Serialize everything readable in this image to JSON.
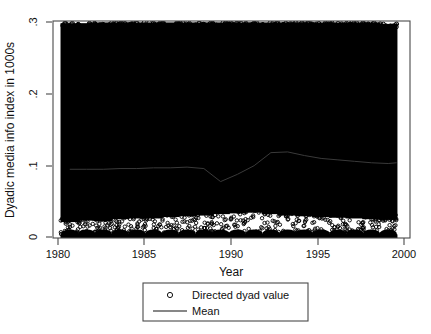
{
  "chart_data": {
    "type": "scatter",
    "title": "",
    "subtitle": "",
    "xlabel": "Year",
    "ylabel": "Dyadic media info index in 1000s",
    "xlim": [
      1979.0,
      2000.3
    ],
    "ylim": [
      0,
      0.3
    ],
    "xticks": [
      1980,
      1985,
      1990,
      1995,
      2000
    ],
    "xticklabels": [
      "1980",
      "1985",
      "1990",
      "1995",
      "2000"
    ],
    "yticks": [
      0,
      0.1,
      0.2,
      0.3
    ],
    "yticklabels": [
      "0",
      ".1",
      ".2",
      ".3"
    ],
    "grid": false,
    "legend_position": "below-center",
    "series": [
      {
        "name": "Directed dyad value",
        "type": "scatter",
        "marker": "open-circle",
        "color": "#000000",
        "note": "Dense vertical columns of directed-dyad observations, one column per year 1980-1999; values saturate the range 0 to ~0.30 with a sparse white band just above 0 and scattered rim markers near 0.02-0.045 and near 0.295",
        "x": [
          1980,
          1981,
          1982,
          1983,
          1984,
          1985,
          1986,
          1987,
          1988,
          1989,
          1990,
          1991,
          1992,
          1993,
          1994,
          1995,
          1996,
          1997,
          1998,
          1999
        ],
        "column_top": [
          0.297,
          0.297,
          0.298,
          0.298,
          0.298,
          0.298,
          0.298,
          0.298,
          0.298,
          0.298,
          0.298,
          0.298,
          0.298,
          0.298,
          0.298,
          0.298,
          0.298,
          0.298,
          0.298,
          0.296
        ],
        "column_bottom": [
          0.0,
          0.0,
          0.0,
          0.0,
          0.0,
          0.0,
          0.0,
          0.0,
          0.0,
          0.0,
          0.0,
          0.0,
          0.0,
          0.0,
          0.0,
          0.0,
          0.0,
          0.0,
          0.0,
          0.0
        ],
        "lower_gap_top": [
          0.022,
          0.024,
          0.023,
          0.026,
          0.027,
          0.027,
          0.029,
          0.03,
          0.031,
          0.033,
          0.034,
          0.035,
          0.033,
          0.031,
          0.03,
          0.029,
          0.028,
          0.027,
          0.026,
          0.025
        ],
        "lower_gap_bottom": [
          0.005,
          0.005,
          0.005,
          0.005,
          0.005,
          0.005,
          0.005,
          0.005,
          0.005,
          0.005,
          0.005,
          0.005,
          0.005,
          0.005,
          0.005,
          0.005,
          0.005,
          0.005,
          0.005,
          0.005
        ]
      },
      {
        "name": "Mean",
        "type": "line",
        "color": "#3a3a3a",
        "x": [
          1980,
          1981,
          1982,
          1983,
          1984,
          1985,
          1986,
          1987,
          1988,
          1989,
          1990,
          1991,
          1992,
          1993,
          1994,
          1995,
          1996,
          1997,
          1998,
          1999,
          1999.5
        ],
        "values": [
          0.095,
          0.095,
          0.095,
          0.096,
          0.096,
          0.097,
          0.097,
          0.098,
          0.096,
          0.078,
          0.088,
          0.1,
          0.118,
          0.119,
          0.114,
          0.11,
          0.108,
          0.106,
          0.104,
          0.103,
          0.104
        ]
      }
    ]
  },
  "axes": {
    "xlabel": "Year",
    "ylabel": "Dyadic media info index in 1000s",
    "xticklabels": [
      "1980",
      "1985",
      "1990",
      "1995",
      "2000"
    ],
    "yticklabels": [
      "0",
      ".1",
      ".2",
      ".3"
    ]
  },
  "legend": {
    "entries": [
      {
        "label": "Directed dyad value",
        "marker": "open-circle"
      },
      {
        "label": "Mean",
        "marker": "line"
      }
    ]
  },
  "colors": {
    "marker": "#000000",
    "mean_line": "#3a3a3a",
    "frame": "#4a4a4a",
    "background": "#ffffff"
  }
}
